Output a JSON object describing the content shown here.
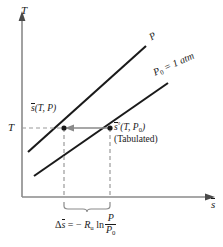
{
  "figure": {
    "type": "thermodynamic-T-s-diagram",
    "background_color": "#ffffff",
    "axis_color": "#8a8a8a",
    "curve_color": "#1a1a1a",
    "dashed_color": "#9a9a9a",
    "arrow_color": "#8a8a8a",
    "text_color": "#1a1a1a"
  },
  "axes": {
    "y_label": "T",
    "x_label": "s",
    "x_label_has_overbar": true,
    "y_tick_label": "T"
  },
  "curves": [
    {
      "id": "line-pressure-p",
      "label": "P",
      "label_plain": "P",
      "description": "upper isobar at pressure P"
    },
    {
      "id": "line-pressure-p0",
      "label_symbol": "P",
      "label_subscript": "0",
      "label_rest": " = 1 atm",
      "label_plain": "P0 = 1 atm",
      "description": "lower reference isobar at 1 atm"
    }
  ],
  "points": [
    {
      "id": "state-point-p",
      "label_symbol": "s",
      "label_rest": "(T, P)",
      "label_plain": "s(T, P)",
      "has_overbar": true,
      "has_degree": false
    },
    {
      "id": "state-point-p0",
      "label_symbol": "s",
      "label_degree": "°",
      "label_rest_open": "(T, P",
      "label_subscript": "0",
      "label_rest_close": ")",
      "label_plain": "s°(T, P0)",
      "has_overbar": true,
      "has_degree": true,
      "note": "(Tabulated)"
    }
  ],
  "annotations": {
    "tabulated_note": "(Tabulated)",
    "arrow_direction": "leftward",
    "brace_caption_plain": "Δs = − Ru ln(P/P0)",
    "equation": {
      "delta": "Δ",
      "s_symbol": "s",
      "equals": " = − ",
      "r_symbol": "R",
      "r_subscript": "u",
      "ln": " ln",
      "numerator": "P",
      "denominator_symbol": "P",
      "denominator_subscript": "0"
    }
  }
}
